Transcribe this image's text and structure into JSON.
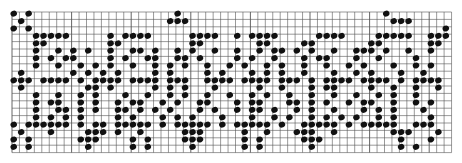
{
  "chart": {
    "title": "",
    "grid": {
      "origin_x": 12,
      "origin_y": 12,
      "cell_w": 7.45,
      "cell_h": 7.4,
      "cols": 59,
      "rows": 19,
      "line_color": "#555555",
      "background": "#ffffff"
    },
    "dot_color": "#111111",
    "legend": "Knitting/stitch chart: black dots mark filled stitches",
    "rows": [
      "x.x...................x...........................x.........",
      ".x...................xxx...........................xxx......",
      "x.x.......................................................x.",
      "...xxxxx.....x.xxxx.....xxxx..x.xxxx.....xxxx....xxxxx..xxx",
      "...xx........xx.........xx.......xx....xx.......xx......xx.",
      "...x..x.x.x..x..xx.x..x.x..x..x..x.xx.x.x..x..xxx.x..x..x.",
      "...x.x.xx....x.x..xx..xx.x....x.x..x...x.xx...x..x....x...",
      "...x..x..x.x.x..x..x.x.x..x..x.x..x.x..x..x..x.x...x..x.x.",
      ".x......x.x.x.x....x.x....x.x...x.x.x..x...x..x.x...x..x..",
      "xxx.xxxx.x.xxxx.xxxx.xxx..xxxx.xxxx.xxx.x.xxxx.xxxx.x.xxxx",
      ".x........xx.x.....x.x.x...x.....x..x...x.xx....x..x..x..x",
      "...x..x..x.x...x..x..x.x..x..x..x.x..x..x..x..x..x.x..x...",
      "...x.xx..x.x..x.xx..x.x..xx...x.xx...xx.x.x..x.xx..x..x.x.",
      "...x..xx.x.x..xx.x.x.x...x.x..x.xx.x..x.x..x...x.x.x...x..",
      "...x.x.x.x....x.x...x.x.x...x...x..x.x..x.x.x.x..x.x....x.",
      "x.xxxxxx.x.xx.xxxxx.x.xxxxx.x.xxxxx.x..xxxxx.x.xxxxx..xxx.",
      ".x...x....xxx.x..x.....xxx.....x..x...xxx..x.......xxx...x",
      "x.x......xxx....x.x....xxx.....x.x.....xxx..........x...x.",
      "x.x.......x.....x.x.....x......x.x......x...........x.x..."
    ]
  }
}
